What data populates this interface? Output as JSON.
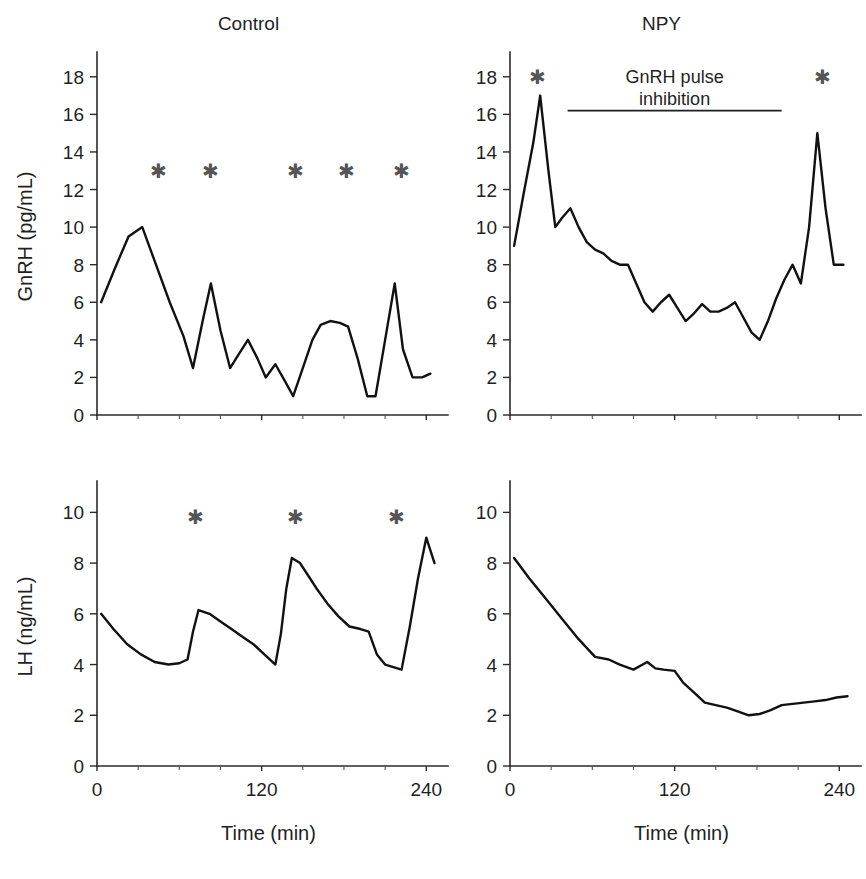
{
  "figure": {
    "background_color": "#ffffff",
    "line_color": "#111111",
    "axis_color": "#2a2a2a",
    "star_color": "#555555",
    "star_glyph": "✱",
    "x_axis_label": "Time (min)",
    "x_ticks_labeled": [
      0,
      120,
      240
    ],
    "x_tick_step_minor": 30,
    "x_range": [
      0,
      250
    ]
  },
  "panels": [
    {
      "id": "gnrh-control",
      "title": "Control",
      "y_axis_label": "GnRH (pg/mL)",
      "show_y_axis_label": true,
      "show_x_axis_label": false,
      "show_x_tick_labels": false,
      "stars": [
        45,
        83,
        145,
        182,
        222
      ],
      "star_y": 13,
      "annotation": null,
      "chart_ref": 0
    },
    {
      "id": "gnrh-npy",
      "title": "NPY",
      "y_axis_label": "GnRH (pg/mL)",
      "show_y_axis_label": false,
      "show_x_axis_label": false,
      "show_x_tick_labels": false,
      "stars": [
        20,
        228
      ],
      "star_y": 18,
      "annotation": {
        "line1": "GnRH pulse",
        "line2": "inhibition",
        "bar_start": 42,
        "bar_end": 198,
        "bar_y": 16.2
      },
      "chart_ref": 1
    },
    {
      "id": "lh-control",
      "title": "",
      "y_axis_label": "LH (ng/mL)",
      "show_y_axis_label": true,
      "show_x_axis_label": true,
      "show_x_tick_labels": true,
      "stars": [
        72,
        145,
        218
      ],
      "star_y": 9.8,
      "annotation": null,
      "chart_ref": 2
    },
    {
      "id": "lh-npy",
      "title": "",
      "y_axis_label": "LH (ng/mL)",
      "show_y_axis_label": false,
      "show_x_axis_label": true,
      "show_x_tick_labels": true,
      "stars": [],
      "star_y": 9.8,
      "annotation": null,
      "chart_ref": 3
    }
  ],
  "chart_data": [
    {
      "type": "line",
      "title": "Control",
      "xlabel": "Time (min)",
      "ylabel": "GnRH (pg/mL)",
      "xlim": [
        0,
        250
      ],
      "ylim": [
        0,
        19
      ],
      "yticks": [
        0,
        2,
        4,
        6,
        8,
        10,
        12,
        14,
        16,
        18
      ],
      "xticks": [
        0,
        30,
        60,
        90,
        120,
        150,
        180,
        210,
        240
      ],
      "grid": false,
      "legend": false,
      "series": [
        {
          "name": "GnRH Control",
          "x": [
            3,
            13,
            23,
            33,
            43,
            53,
            63,
            70,
            77,
            83,
            90,
            97,
            103,
            110,
            117,
            123,
            130,
            137,
            143,
            150,
            157,
            163,
            170,
            177,
            183,
            190,
            197,
            203,
            210,
            217,
            223,
            230,
            237,
            243
          ],
          "y": [
            6.0,
            7.8,
            9.5,
            10.0,
            8.0,
            6.0,
            4.2,
            2.5,
            5.0,
            7.0,
            4.5,
            2.5,
            3.2,
            4.0,
            3.0,
            2.0,
            2.7,
            1.8,
            1.0,
            2.5,
            4.0,
            4.8,
            5.0,
            4.9,
            4.7,
            3.0,
            1.0,
            1.0,
            4.0,
            7.0,
            3.5,
            2.0,
            2.0,
            2.2
          ]
        }
      ],
      "annotations": {
        "significance_markers": {
          "symbol": "*",
          "x_positions": [
            45,
            83,
            145,
            182,
            222
          ],
          "y": 13
        }
      }
    },
    {
      "type": "line",
      "title": "NPY",
      "xlabel": "Time (min)",
      "ylabel": "GnRH (pg/mL)",
      "xlim": [
        0,
        250
      ],
      "ylim": [
        0,
        19
      ],
      "yticks": [
        0,
        2,
        4,
        6,
        8,
        10,
        12,
        14,
        16,
        18
      ],
      "xticks": [
        0,
        30,
        60,
        90,
        120,
        150,
        180,
        210,
        240
      ],
      "grid": false,
      "legend": false,
      "series": [
        {
          "name": "GnRH NPY",
          "x": [
            3,
            10,
            17,
            22,
            28,
            33,
            38,
            44,
            50,
            56,
            62,
            68,
            74,
            80,
            86,
            92,
            98,
            104,
            110,
            116,
            122,
            128,
            134,
            140,
            146,
            152,
            158,
            164,
            170,
            176,
            182,
            188,
            194,
            200,
            206,
            212,
            218,
            224,
            230,
            236,
            243
          ],
          "y": [
            9.0,
            11.8,
            14.5,
            17.0,
            13.0,
            10.0,
            10.5,
            11.0,
            10.0,
            9.2,
            8.8,
            8.6,
            8.2,
            8.0,
            8.0,
            7.0,
            6.0,
            5.5,
            6.0,
            6.4,
            5.7,
            5.0,
            5.4,
            5.9,
            5.5,
            5.5,
            5.7,
            6.0,
            5.2,
            4.4,
            4.0,
            5.0,
            6.2,
            7.2,
            8.0,
            7.0,
            10.0,
            15.0,
            11.0,
            8.0,
            8.0
          ]
        }
      ],
      "annotations": {
        "significance_markers": {
          "symbol": "*",
          "x_positions": [
            20,
            228
          ],
          "y": 18
        },
        "text_annotation": {
          "text": "GnRH pulse inhibition",
          "bar_span_min": [
            42,
            198
          ]
        }
      }
    },
    {
      "type": "line",
      "title": "Control",
      "xlabel": "Time (min)",
      "ylabel": "LH (ng/mL)",
      "xlim": [
        0,
        250
      ],
      "ylim": [
        0,
        11
      ],
      "yticks": [
        0,
        2,
        4,
        6,
        8,
        10
      ],
      "xticks": [
        0,
        30,
        60,
        90,
        120,
        150,
        180,
        210,
        240
      ],
      "grid": false,
      "legend": false,
      "series": [
        {
          "name": "LH Control",
          "x": [
            3,
            12,
            22,
            32,
            42,
            52,
            60,
            66,
            70,
            74,
            82,
            90,
            98,
            106,
            114,
            122,
            130,
            134,
            138,
            142,
            148,
            154,
            160,
            168,
            176,
            184,
            192,
            198,
            204,
            210,
            216,
            222,
            228,
            234,
            240,
            246
          ],
          "y": [
            6.0,
            5.4,
            4.8,
            4.4,
            4.1,
            4.0,
            4.05,
            4.2,
            5.3,
            6.15,
            6.0,
            5.7,
            5.4,
            5.1,
            4.8,
            4.4,
            4.0,
            5.2,
            7.0,
            8.2,
            8.0,
            7.5,
            7.0,
            6.4,
            5.9,
            5.5,
            5.4,
            5.3,
            4.4,
            4.0,
            3.9,
            3.8,
            5.5,
            7.4,
            9.0,
            8.0
          ]
        }
      ],
      "annotations": {
        "significance_markers": {
          "symbol": "*",
          "x_positions": [
            72,
            145,
            218
          ],
          "y": 9.8
        }
      }
    },
    {
      "type": "line",
      "title": "NPY",
      "xlabel": "Time (min)",
      "ylabel": "LH (ng/mL)",
      "xlim": [
        0,
        250
      ],
      "ylim": [
        0,
        11
      ],
      "yticks": [
        0,
        2,
        4,
        6,
        8,
        10
      ],
      "xticks": [
        0,
        30,
        60,
        90,
        120,
        150,
        180,
        210,
        240
      ],
      "grid": false,
      "legend": false,
      "series": [
        {
          "name": "LH NPY",
          "x": [
            3,
            14,
            26,
            38,
            50,
            62,
            72,
            80,
            90,
            100,
            106,
            112,
            120,
            126,
            134,
            142,
            150,
            158,
            166,
            174,
            182,
            190,
            198,
            206,
            214,
            222,
            230,
            238,
            246
          ],
          "y": [
            8.2,
            7.4,
            6.6,
            5.8,
            5.0,
            4.3,
            4.2,
            4.0,
            3.8,
            4.1,
            3.85,
            3.8,
            3.75,
            3.3,
            2.9,
            2.5,
            2.4,
            2.3,
            2.15,
            2.0,
            2.05,
            2.2,
            2.4,
            2.45,
            2.5,
            2.55,
            2.6,
            2.7,
            2.75
          ]
        }
      ],
      "annotations": {
        "significance_markers": {
          "symbol": "*",
          "x_positions": [],
          "y": 9.8
        }
      }
    }
  ]
}
